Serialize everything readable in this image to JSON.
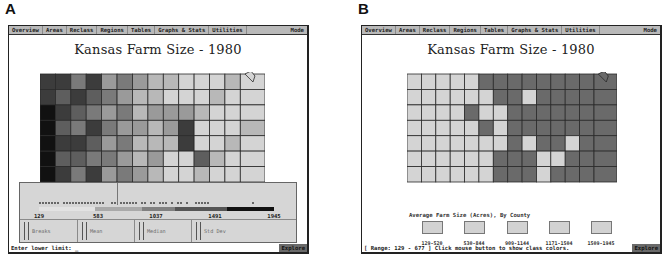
{
  "panels": [
    {
      "letter": "A",
      "menu": [
        "Overview",
        "Areas",
        "Reclass",
        "Regions",
        "Tables",
        "Graphs & Stats",
        "Utilities",
        "Mode"
      ],
      "title": "Kansas Farm Size - 1980",
      "histogram": {
        "tick_labels": [
          "129",
          "583",
          "1037",
          "1491",
          "1945"
        ],
        "class_shades": [
          "#e2e2e2",
          "#a9a9a9",
          "#808080",
          "#555555",
          "#111111"
        ],
        "class_breaks_fraction": [
          0,
          0.24,
          0.44,
          0.58,
          0.8,
          1.0
        ],
        "stat_buttons": [
          "Breaks",
          "Mean",
          "Median",
          "Std Dev"
        ]
      },
      "status": {
        "text": "Enter lower limit: _",
        "mode_label": "Explore"
      },
      "map_shades": [
        "#111111",
        "#3c3c3c",
        "#5e5e5e",
        "#7a7a7a",
        "#9a9a9a",
        "#b8b8b8",
        "#d4d4d4"
      ]
    },
    {
      "letter": "B",
      "menu": [
        "Overview",
        "Areas",
        "Reclass",
        "Regions",
        "Tables",
        "Graphs & Stats",
        "Utilities",
        "Mode"
      ],
      "title": "Kansas Farm Size - 1980",
      "legend": {
        "title": "Average Farm Size (Acres), By County",
        "classes": [
          {
            "label": "129-520",
            "color": "#d2d2d2"
          },
          {
            "label": "530-844",
            "color": "#d2d2d2"
          },
          {
            "label": "909-1144",
            "color": "#d2d2d2"
          },
          {
            "label": "1171-1504",
            "color": "#d2d2d2"
          },
          {
            "label": "1509-1945",
            "color": "#d2d2d2"
          }
        ]
      },
      "status": {
        "text": "[ Range: 129 - 677 ]  Click mouse button to show class colors.",
        "mode_label": "Explore"
      },
      "map_shades": [
        "#d4d4d4",
        "#6a6a6a"
      ]
    }
  ]
}
